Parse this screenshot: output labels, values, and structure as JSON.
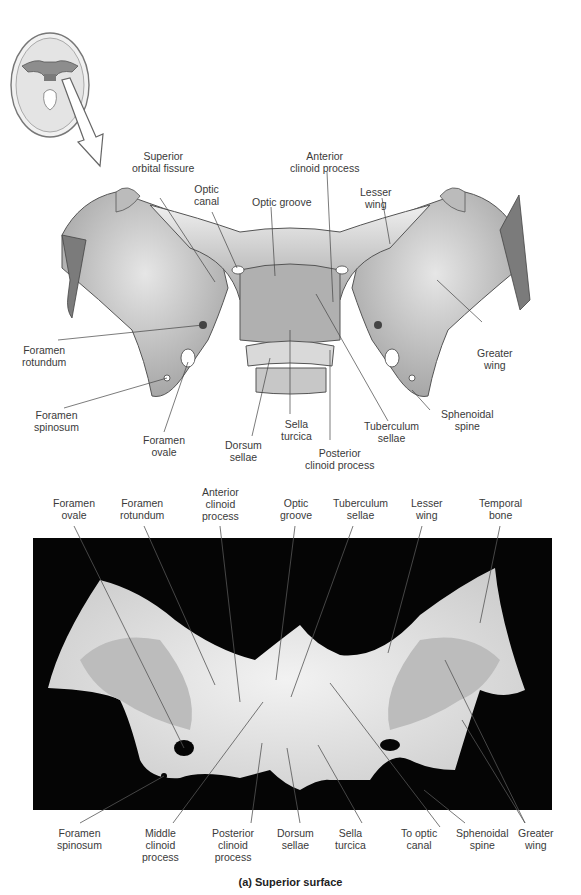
{
  "figure": {
    "caption": "(a) Superior surface",
    "colors": {
      "background": "#ffffff",
      "photo_background": "#050505",
      "bone_light": "#e9e9e9",
      "bone_mid": "#bdbdbd",
      "bone_dark": "#8a8a8a",
      "leader_line": "#444444"
    }
  },
  "inset": {
    "description": "Skull base viewed superiorly with sphenoid highlighted",
    "arrow": "down-right-arrow"
  },
  "illustration": {
    "labels": [
      {
        "id": "superior-orbital-fissure",
        "lines": [
          "Superior",
          "orbital fissure"
        ]
      },
      {
        "id": "anterior-clinoid-process",
        "lines": [
          "Anterior",
          "clinoid process"
        ]
      },
      {
        "id": "optic-canal",
        "lines": [
          "Optic",
          "canal"
        ]
      },
      {
        "id": "optic-groove",
        "lines": [
          "Optic groove"
        ]
      },
      {
        "id": "lesser-wing",
        "lines": [
          "Lesser",
          "wing"
        ]
      },
      {
        "id": "foramen-rotundum",
        "lines": [
          "Foramen",
          "rotundum"
        ]
      },
      {
        "id": "greater-wing",
        "lines": [
          "Greater",
          "wing"
        ]
      },
      {
        "id": "foramen-spinosum",
        "lines": [
          "Foramen",
          "spinosum"
        ]
      },
      {
        "id": "foramen-ovale",
        "lines": [
          "Foramen",
          "ovale"
        ]
      },
      {
        "id": "dorsum-sellae",
        "lines": [
          "Dorsum",
          "sellae"
        ]
      },
      {
        "id": "sella-turcica",
        "lines": [
          "Sella",
          "turcica"
        ]
      },
      {
        "id": "tuberculum-sellae",
        "lines": [
          "Tuberculum",
          "sellae"
        ]
      },
      {
        "id": "sphenoidal-spine",
        "lines": [
          "Sphenoidal",
          "spine"
        ]
      },
      {
        "id": "posterior-clinoid-process",
        "lines": [
          "Posterior",
          "clinoid process"
        ]
      }
    ]
  },
  "photo": {
    "top_labels": [
      {
        "id": "foramen-ovale",
        "lines": [
          "Foramen",
          "ovale"
        ]
      },
      {
        "id": "foramen-rotundum",
        "lines": [
          "Foramen",
          "rotundum"
        ]
      },
      {
        "id": "anterior-clinoid-process",
        "lines": [
          "Anterior",
          "clinoid",
          "process"
        ]
      },
      {
        "id": "optic-groove",
        "lines": [
          "Optic",
          "groove"
        ]
      },
      {
        "id": "tuberculum-sellae",
        "lines": [
          "Tuberculum",
          "sellae"
        ]
      },
      {
        "id": "lesser-wing",
        "lines": [
          "Lesser",
          "wing"
        ]
      },
      {
        "id": "temporal-bone",
        "lines": [
          "Temporal",
          "bone"
        ]
      }
    ],
    "bottom_labels": [
      {
        "id": "foramen-spinosum",
        "lines": [
          "Foramen",
          "spinosum"
        ]
      },
      {
        "id": "middle-clinoid-process",
        "lines": [
          "Middle",
          "clinoid",
          "process"
        ]
      },
      {
        "id": "posterior-clinoid-process",
        "lines": [
          "Posterior",
          "clinoid",
          "process"
        ]
      },
      {
        "id": "dorsum-sellae",
        "lines": [
          "Dorsum",
          "sellae"
        ]
      },
      {
        "id": "sella-turcica",
        "lines": [
          "Sella",
          "turcica"
        ]
      },
      {
        "id": "to-optic-canal",
        "lines": [
          "To optic",
          "canal"
        ]
      },
      {
        "id": "sphenoidal-spine",
        "lines": [
          "Sphenoidal",
          "spine"
        ]
      },
      {
        "id": "greater-wing",
        "lines": [
          "Greater",
          "wing"
        ]
      }
    ]
  }
}
